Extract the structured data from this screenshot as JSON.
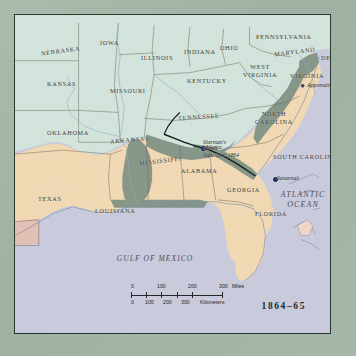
{
  "map": {
    "title_caption": "1864–65",
    "states": [
      {
        "name": "NEBRASKA",
        "x": 26,
        "y": 33,
        "rot": -8
      },
      {
        "name": "IOWA",
        "x": 85,
        "y": 25,
        "rot": 0
      },
      {
        "name": "ILLINOIS",
        "x": 126,
        "y": 40,
        "rot": 0
      },
      {
        "name": "INDIANA",
        "x": 169,
        "y": 34,
        "rot": 0
      },
      {
        "name": "OHIO",
        "x": 205,
        "y": 30,
        "rot": 0
      },
      {
        "name": "PENNSYLVANIA",
        "x": 241,
        "y": 19,
        "rot": 0
      },
      {
        "name": "MARYLAND",
        "x": 259,
        "y": 34,
        "rot": -7
      },
      {
        "name": "DEL.",
        "x": 306,
        "y": 40,
        "rot": 0
      },
      {
        "name": "KANSAS",
        "x": 32,
        "y": 66,
        "rot": 0
      },
      {
        "name": "MISSOURI",
        "x": 95,
        "y": 73,
        "rot": 0
      },
      {
        "name": "KENTUCKY",
        "x": 172,
        "y": 63,
        "rot": 0
      },
      {
        "name": "WEST VIRGINIA",
        "x": 228,
        "y": 48,
        "rot": 0
      },
      {
        "name": "VIRGINIA",
        "x": 275,
        "y": 58,
        "rot": 0
      },
      {
        "name": "OKLAHOMA",
        "x": 32,
        "y": 115,
        "rot": 0
      },
      {
        "name": "ARKANSAS",
        "x": 95,
        "y": 122,
        "rot": -5
      },
      {
        "name": "TENNESSEE",
        "x": 163,
        "y": 99,
        "rot": -4
      },
      {
        "name": "NORTH CAROLINA",
        "x": 240,
        "y": 95,
        "rot": 0
      },
      {
        "name": "MISSISSIPPI",
        "x": 124,
        "y": 143,
        "rot": -7
      },
      {
        "name": "ALABAMA",
        "x": 166,
        "y": 153,
        "rot": 0
      },
      {
        "name": "GEORGIA",
        "x": 212,
        "y": 172,
        "rot": 0
      },
      {
        "name": "SOUTH CAROLINA",
        "x": 258,
        "y": 139,
        "rot": 0
      },
      {
        "name": "TEXAS",
        "x": 23,
        "y": 181,
        "rot": 0
      },
      {
        "name": "LOUISIANA",
        "x": 80,
        "y": 193,
        "rot": 0
      },
      {
        "name": "FLORIDA",
        "x": 240,
        "y": 196,
        "rot": 0
      }
    ],
    "oceans": [
      {
        "name": "ATLANTIC OCEAN",
        "x": 288,
        "y": 175
      },
      {
        "name": "GULF OF MEXICO",
        "x": 140,
        "y": 240
      }
    ],
    "cities": [
      {
        "name": "Atlanta",
        "x": 190,
        "y": 130
      },
      {
        "name": "Savannah",
        "x": 262,
        "y": 161
      }
    ],
    "battles": [
      {
        "name": "Appomattox",
        "x": 292,
        "y": 68
      }
    ],
    "annotations": [
      {
        "line1": "Sherman's",
        "line2": "March",
        "line3": "Sept.–Dec.  1864",
        "x": 206,
        "y": 124
      }
    ]
  },
  "scale": {
    "miles_label": "Miles",
    "km_label": "Kilometers",
    "miles_ticks": [
      "0",
      "100",
      "200",
      "300"
    ],
    "km_ticks": [
      "0",
      "100",
      "200",
      "300"
    ]
  },
  "colors": {
    "union": "#d3e4dc",
    "confederacy": "#f2d9b4",
    "union_occupied": "#7e9184",
    "water": "#c9cbdd",
    "border": "#2c3630",
    "margin": "#a2b5a6"
  }
}
